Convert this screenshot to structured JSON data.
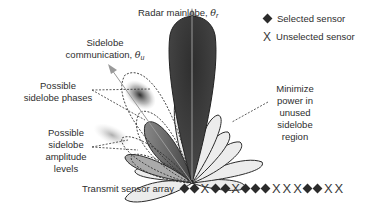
{
  "diagram": {
    "labels": {
      "mainlobe": {
        "text": "Radar mainlobe, ",
        "symbol": "θ",
        "subscript": "r"
      },
      "sidelobe_comm": {
        "line1": "Sidelobe",
        "line2": "communication, ",
        "symbol": "θ",
        "subscript": "u"
      },
      "sidelobe_phases": {
        "line1": "Possible",
        "line2": "sidelobe phases"
      },
      "sidelobe_amplitude": {
        "line1": "Possible",
        "line2": "sidelobe",
        "line3": "amplitude",
        "line4": "levels"
      },
      "minimize_power": {
        "line1": "Minimize",
        "line2": "power in",
        "line3": "unused",
        "line4": "sidelobe",
        "line5": "region"
      },
      "transmit_array": "Transmit sensor array"
    },
    "legend": [
      {
        "marker": "diamond",
        "label": "Selected sensor"
      },
      {
        "marker": "x",
        "label": "Unselected sensor"
      }
    ],
    "sensor_array": [
      "diamond",
      "diamond",
      "x",
      "diamond",
      "diamond",
      "x",
      "diamond",
      "diamond",
      "diamond",
      "x",
      "x",
      "x",
      "diamond",
      "diamond",
      "x",
      "x"
    ],
    "colors": {
      "mainlobe": "#3c3c3c",
      "sidelobe_fill": "#ececec",
      "outline": "#2a2a2a",
      "arrow": "#9a9a9a"
    }
  }
}
